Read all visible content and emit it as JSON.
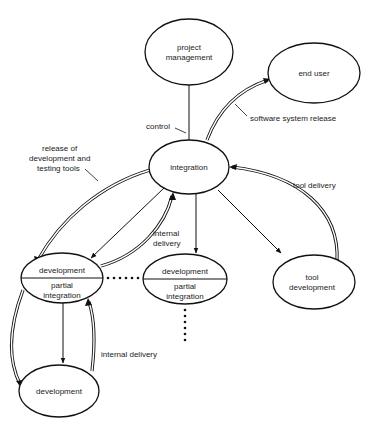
{
  "nodes": {
    "project_management": {
      "line1": "project",
      "line2": "management"
    },
    "end_user": {
      "label": "end user"
    },
    "integration": {
      "label": "integration"
    },
    "dev_left": {
      "top": "development",
      "bottom1": "partial",
      "bottom2": "integration"
    },
    "dev_center": {
      "top": "development",
      "bottom1": "partial",
      "bottom2": "integration"
    },
    "tool_development": {
      "line1": "tool",
      "line2": "development"
    },
    "dev_bottom": {
      "label": "development"
    }
  },
  "edges": {
    "control": {
      "label": "control"
    },
    "software_release": {
      "label": "software system release"
    },
    "release_tools": {
      "line1": "release of",
      "line2": "development and",
      "line3": "testing tools"
    },
    "tool_delivery": {
      "label": "tool delivery"
    },
    "internal_delivery_top": {
      "line1": "internal",
      "line2": "delivery"
    },
    "internal_delivery_bottom": {
      "label": "internal delivery"
    }
  }
}
